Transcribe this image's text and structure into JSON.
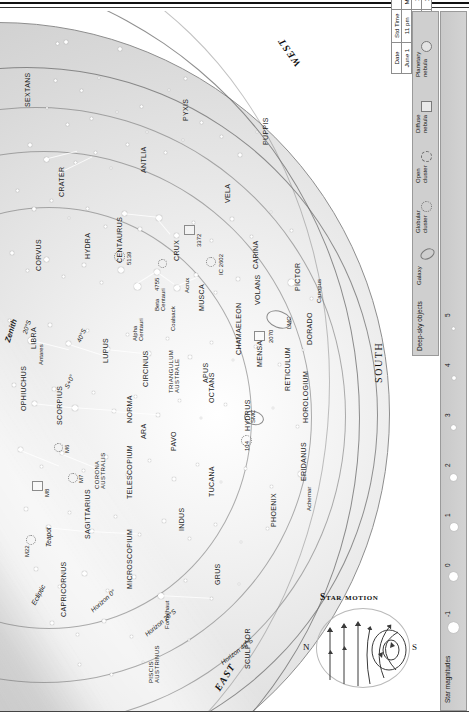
{
  "chart": {
    "cardinals": {
      "west": "WEST",
      "east": "EAST",
      "south": "SOUTH"
    },
    "zenith_label": "Zenith",
    "ecliptic_label": "Ecliptic",
    "horizon_labels": [
      "Horizon 0°",
      "Horizon 20°S",
      "Horizon 40°S"
    ],
    "latitude_marks": [
      "20°S",
      "40°S"
    ],
    "constellations": [
      "SEXTANS",
      "CRATER",
      "CORVUS",
      "HYDRA",
      "ANTLIA",
      "PYXIS",
      "VELA",
      "PUPPIS",
      "CARINA",
      "CRUX",
      "MUSCA",
      "CENTAURUS",
      "LUPUS",
      "CIRCINUS",
      "NORMA",
      "TRIANGULUM AUSTRALE",
      "APUS",
      "CHAMAELEON",
      "VOLANS",
      "PICTOR",
      "DORADO",
      "RETICULUM",
      "MENSA",
      "HOROLOGIUM",
      "ERIDANUS",
      "PHOENIX",
      "HYDRUS",
      "TUCANA",
      "OCTANS",
      "PAVO",
      "ARA",
      "TELESCOPIUM",
      "INDUS",
      "GRUS",
      "MICROSCOPIUM",
      "SCULPTOR",
      "PISCIS AUSTRINUS",
      "CAPRICORNUS",
      "SAGITTARIUS",
      "CORONA AUSTRALIS",
      "SCORPIUS",
      "OPHIUCHUS",
      "LIBRA"
    ],
    "stars_named": [
      "Antares",
      "Acrux",
      "Alpha Centauri",
      "Beta Centauri",
      "Canopus",
      "Achernar",
      "Fomalhaut"
    ],
    "deep_sky_marks": [
      "M22",
      "M8",
      "M6",
      "M7",
      "5139",
      "4755",
      "3372",
      "IC 2602",
      "2070",
      "104",
      "LMC",
      "SMC",
      "Coalsack",
      "Teapot"
    ]
  },
  "star_motion": {
    "title": "Star motion",
    "north": "N",
    "south": "S"
  },
  "legend": {
    "deep_sky_title": "Deep-sky objects",
    "deep_sky_items": [
      {
        "label": "Galaxy",
        "icon": "galaxy-ellipse-icon"
      },
      {
        "label": "Globular cluster",
        "icon": "globular-cluster-icon"
      },
      {
        "label": "Open cluster",
        "icon": "open-cluster-icon"
      },
      {
        "label": "Diffuse nebula",
        "icon": "diffuse-nebula-square-icon"
      },
      {
        "label": "Planetary nebula",
        "icon": "planetary-nebula-circle-icon"
      }
    ],
    "magnitudes_title": "Star magnitudes",
    "magnitudes": [
      "-1",
      "0",
      "1",
      "2",
      "3",
      "4",
      "5"
    ]
  },
  "time_table": {
    "headers": [
      "Date",
      "Std Time",
      "DST"
    ],
    "rows": [
      [
        "June 1",
        "11 pm",
        "Midnight"
      ],
      [
        "June 15",
        "10 pm",
        "11 pm"
      ],
      [
        "June 30",
        "9 pm",
        "10 pm"
      ]
    ]
  }
}
